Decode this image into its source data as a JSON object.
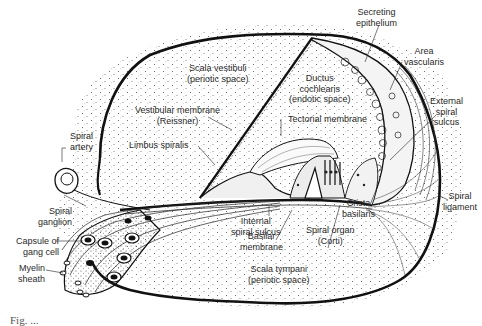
{
  "figure": {
    "labels": {
      "secreting_epithelium": [
        "Secreting",
        "epithelium"
      ],
      "area_vascularis": [
        "Area",
        "vascularis"
      ],
      "scala_vestibuli": [
        "Scala vestibuli",
        "(periotic space)"
      ],
      "ductus_cochlearis": [
        "Ductus",
        "cochlearis",
        "(endotic space)"
      ],
      "external_spiral_sulcus": [
        "External",
        "spiral",
        "sulcus"
      ],
      "vestibular_membrane": [
        "Vestibular membrane",
        "(Reissner)"
      ],
      "tectorial_membrane": [
        "Tectorial membrane"
      ],
      "spiral_artery": [
        "Spiral",
        "artery"
      ],
      "limbus_spiralis": [
        "Limbus spiralis"
      ],
      "spiral_ligament": [
        "Spiral",
        "ligament"
      ],
      "spiral_ganglion": [
        "Spiral",
        "ganglion"
      ],
      "internal_spiral_sulcus": [
        "Internal",
        "spiral sulcus"
      ],
      "crista_basilaris": [
        "Crista",
        "basilaris"
      ],
      "capsule_of_gang_cell": [
        "Capsule of",
        "gang cell"
      ],
      "basilar_membrane": [
        "Basilar",
        "membrane"
      ],
      "spiral_organ": [
        "Spiral organ",
        "(Corti)"
      ],
      "myelin_sheath": [
        "Myelin",
        "sheath"
      ],
      "scala_tympani": [
        "Scala tympani",
        "(periotic space)"
      ]
    },
    "caption": "Fig. ..."
  }
}
